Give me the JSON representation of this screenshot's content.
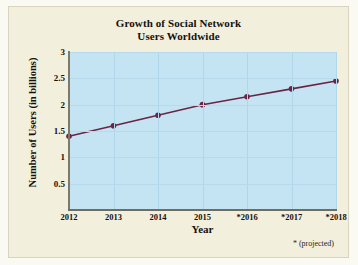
{
  "figure": {
    "title_line1": "Growth of Social Network",
    "title_line2": "Users Worldwide",
    "footnote": "* (projected)",
    "panel_color": "#f2efdd",
    "plot_color": "#c5e4f3",
    "series_color": "#6b2444"
  },
  "chart_data": {
    "type": "line",
    "title": "Growth of Social Network Users Worldwide",
    "xlabel": "Year",
    "ylabel": "Number of Users (in billions)",
    "categories": [
      "2012",
      "2013",
      "2014",
      "2015",
      "*2016",
      "*2017",
      "*2018"
    ],
    "x_tick_labels": [
      "2012",
      "2013",
      "2014",
      "2015",
      "*2016",
      "*2017",
      "*2018"
    ],
    "y_tick_labels": [
      "0.5",
      "1",
      "1.5",
      "2",
      "2.5",
      "3"
    ],
    "y_ticks": [
      0.5,
      1,
      1.5,
      2,
      2.5,
      3
    ],
    "values": [
      1.4,
      1.6,
      1.8,
      2.0,
      2.15,
      2.3,
      2.45
    ],
    "series": [
      {
        "name": "Number of Users (in billions)",
        "values": [
          1.4,
          1.6,
          1.8,
          2.0,
          2.15,
          2.3,
          2.45
        ]
      }
    ],
    "ylim": [
      0,
      3
    ],
    "grid": true,
    "legend": "none",
    "marker": "circle",
    "annotation": "* (projected)",
    "line_color": "#6b2444",
    "marker_color": "#6b2444"
  }
}
